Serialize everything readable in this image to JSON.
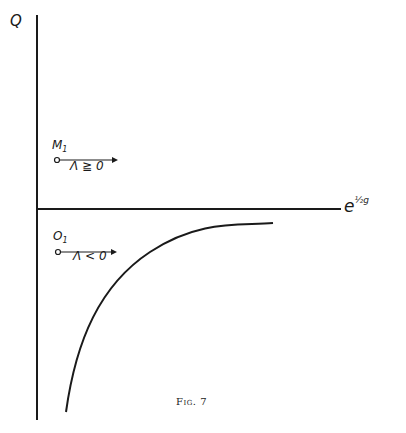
{
  "figure": {
    "caption": "Fig. 7",
    "y_axis_label": "Q",
    "x_axis_label_base": "e",
    "x_axis_label_exponent": "½g",
    "points": [
      {
        "name": "M",
        "subscript": "1",
        "arrow_label": "Λ ≧ 0"
      },
      {
        "name": "O",
        "subscript": "1",
        "arrow_label": "Λ < 0"
      }
    ],
    "curve": "hyperbola-like curve below x-axis asymptotically approaching it from below",
    "colors": {
      "ink": "#1a1a1a",
      "background": "#ffffff"
    }
  }
}
